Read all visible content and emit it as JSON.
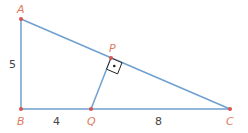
{
  "diagram": {
    "type": "right-triangle-with-altitude",
    "colors": {
      "line": "#6fa0d0",
      "point": "#d9534f",
      "label": "#e07a5f",
      "text": "#444444",
      "marker": "#222222"
    },
    "points": [
      {
        "name": "A",
        "x": 21,
        "y": 19
      },
      {
        "name": "B",
        "x": 21,
        "y": 109
      },
      {
        "name": "Q",
        "x": 91,
        "y": 109
      },
      {
        "name": "C",
        "x": 230,
        "y": 109
      },
      {
        "name": "P",
        "x": 111,
        "y": 58
      }
    ],
    "lengths": {
      "AB": "5",
      "BQ": "4",
      "QC": "8"
    },
    "labels": {
      "A": "A",
      "B": "B",
      "C": "C",
      "P": "P",
      "Q": "Q"
    }
  }
}
